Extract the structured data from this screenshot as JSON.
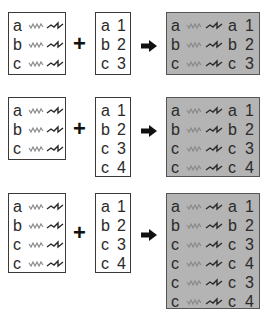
{
  "diagram": {
    "type": "join-illustration",
    "operators": {
      "plus": "+",
      "arrow": "➡"
    },
    "panels": [
      {
        "left": {
          "rows": [
            {
              "key": "a"
            },
            {
              "key": "b"
            },
            {
              "key": "c"
            }
          ]
        },
        "right": {
          "rows": [
            {
              "key": "a",
              "value": "1"
            },
            {
              "key": "b",
              "value": "2"
            },
            {
              "key": "c",
              "value": "3"
            }
          ]
        },
        "result": {
          "rows": [
            {
              "key": "a",
              "rkey": "a",
              "value": "1"
            },
            {
              "key": "b",
              "rkey": "b",
              "value": "2"
            },
            {
              "key": "c",
              "rkey": "c",
              "value": "3"
            }
          ]
        }
      },
      {
        "left": {
          "rows": [
            {
              "key": "a"
            },
            {
              "key": "b"
            },
            {
              "key": "c"
            }
          ]
        },
        "right": {
          "rows": [
            {
              "key": "a",
              "value": "1"
            },
            {
              "key": "b",
              "value": "2"
            },
            {
              "key": "c",
              "value": "3"
            },
            {
              "key": "c",
              "value": "4"
            }
          ]
        },
        "result": {
          "rows": [
            {
              "key": "a",
              "rkey": "a",
              "value": "1"
            },
            {
              "key": "b",
              "rkey": "b",
              "value": "2"
            },
            {
              "key": "c",
              "rkey": "c",
              "value": "3"
            },
            {
              "key": "c",
              "rkey": "c",
              "value": "4"
            }
          ]
        }
      },
      {
        "left": {
          "rows": [
            {
              "key": "a"
            },
            {
              "key": "b"
            },
            {
              "key": "c"
            },
            {
              "key": "c"
            }
          ]
        },
        "right": {
          "rows": [
            {
              "key": "a",
              "value": "1"
            },
            {
              "key": "b",
              "value": "2"
            },
            {
              "key": "c",
              "value": "3"
            },
            {
              "key": "c",
              "value": "4"
            }
          ]
        },
        "result": {
          "rows": [
            {
              "key": "a",
              "rkey": "a",
              "value": "1"
            },
            {
              "key": "b",
              "rkey": "b",
              "value": "2"
            },
            {
              "key": "c",
              "rkey": "c",
              "value": "3"
            },
            {
              "key": "c",
              "rkey": "c",
              "value": "4"
            },
            {
              "key": "c",
              "rkey": "c",
              "value": "3"
            },
            {
              "key": "c",
              "rkey": "c",
              "value": "4"
            }
          ]
        }
      }
    ],
    "colors": {
      "result_fill": "#b4b4b4",
      "border": "#3a3a3a",
      "squiggle_light": "#8a8a8a",
      "squiggle_dark": "#2a2a2a"
    }
  }
}
